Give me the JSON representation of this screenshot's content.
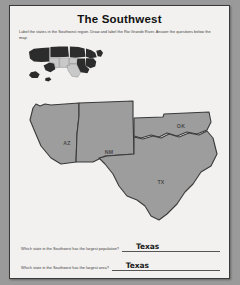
{
  "page": {
    "title": "The Southwest",
    "instructions": "Label the states in the Southwest region. Draw and label the Rio Grande River. Answer the questions below the map.",
    "paper_color": "#f2f1ef",
    "border_color": "#3a3a3a",
    "backdrop_color": "#9a9a9a"
  },
  "locator_map": {
    "name": "united-states-locator-map",
    "highlight_color": "#c9c9c9",
    "base_color": "#2c2c2c",
    "highlighted_region": "Southwest"
  },
  "main_map": {
    "name": "southwest-region-map",
    "fill_color": "#9d9d9d",
    "outline_color": "#3a3a3a",
    "states": [
      {
        "abbr": "AZ",
        "name": "Arizona",
        "label_x": 46,
        "label_y": 57
      },
      {
        "abbr": "NM",
        "name": "New Mexico",
        "label_x": 88,
        "label_y": 66
      },
      {
        "abbr": "OK",
        "name": "Oklahoma",
        "label_x": 158,
        "label_y": 52
      },
      {
        "abbr": "TX",
        "name": "Texas",
        "label_x": 143,
        "label_y": 100
      }
    ]
  },
  "questions": [
    {
      "prompt": "Which state in the Southwest has the largest population?",
      "answer": "Texas"
    },
    {
      "prompt": "Which state in the Southwest has the largest area?",
      "answer": "Texas"
    }
  ]
}
